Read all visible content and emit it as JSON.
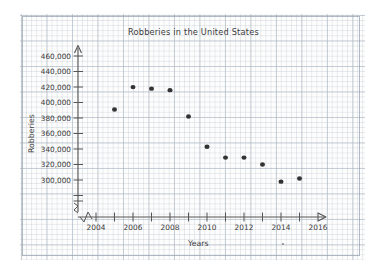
{
  "chart_data": {
    "type": "scatter",
    "title": "Robberies in the United States",
    "xlabel": "Years",
    "ylabel": "Robberies",
    "x": [
      2005,
      2006,
      2007,
      2008,
      2009,
      2010,
      2011,
      2012,
      2013,
      2014,
      2015
    ],
    "values": [
      418000,
      447000,
      445000,
      443000,
      409000,
      370000,
      356000,
      356000,
      347000,
      325000,
      329000
    ],
    "series": [
      {
        "name": "Robberies",
        "points": [
          {
            "x": 2005,
            "y": 418000
          },
          {
            "x": 2006,
            "y": 447000
          },
          {
            "x": 2007,
            "y": 445000
          },
          {
            "x": 2008,
            "y": 443000
          },
          {
            "x": 2009,
            "y": 409000
          },
          {
            "x": 2010,
            "y": 370000
          },
          {
            "x": 2011,
            "y": 356000
          },
          {
            "x": 2012,
            "y": 356000
          },
          {
            "x": 2013,
            "y": 347000
          },
          {
            "x": 2014,
            "y": 325000
          },
          {
            "x": 2015,
            "y": 329000
          }
        ]
      }
    ],
    "xlim": [
      2003.4,
      2017.2
    ],
    "ylim": [
      292000,
      468000
    ],
    "x_tick_values": [
      2004,
      2005,
      2006,
      2007,
      2008,
      2009,
      2010,
      2011,
      2012,
      2013,
      2014,
      2015,
      2016
    ],
    "x_tick_labels": [
      "2004",
      "",
      "2006",
      "",
      "2008",
      "",
      "2010",
      "",
      "2012",
      "",
      "2014",
      "",
      "2016"
    ],
    "x_tick_labels_shown": [
      "2004",
      "2006",
      "2008",
      "2010",
      "2012",
      "2014",
      "2016"
    ],
    "y_tick_values": [
      300000,
      320000,
      340000,
      360000,
      380000,
      400000,
      420000,
      440000,
      460000
    ],
    "y_tick_labels": [
      "300,000",
      "320,000",
      "340,000",
      "360,000",
      "380,000",
      "400,000",
      "420,000",
      "440,000",
      "460,000"
    ],
    "grid": true,
    "grid_style": "graph-paper",
    "legend": null,
    "axis_break_x": true,
    "axis_break_y": true,
    "marker_color": "#333333",
    "axis_color": "#555555",
    "background_color": "#fdfdfd"
  },
  "annotations": {
    "stray_mark": "."
  }
}
